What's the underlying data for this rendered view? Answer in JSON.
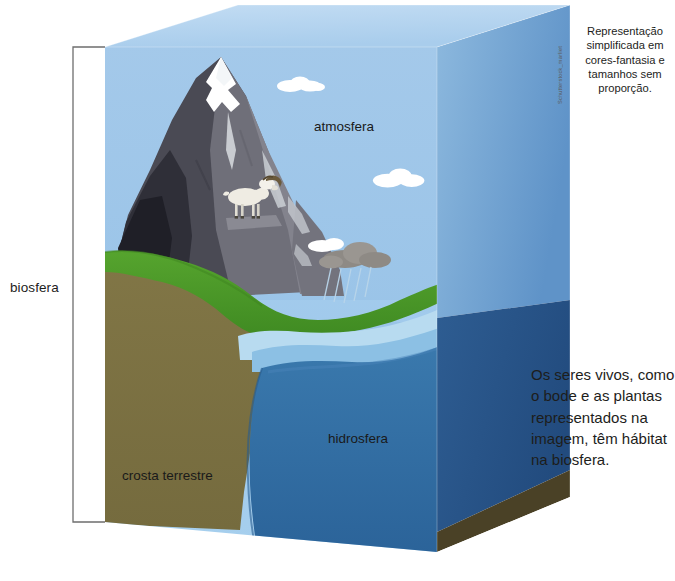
{
  "figure": {
    "title_credit": "Schutterstock_marliet",
    "caption": "Representação simplificada em cores-fantasia e tamanhos sem proporção.",
    "side_note": "Os seres vivos, como o bode e as plantas representados na imagem, têm hábitat na biosfera.",
    "bracket_label": "biosfera",
    "layers": [
      {
        "key": "atmosfera",
        "label": "atmosfera"
      },
      {
        "key": "hidrosfera",
        "label": "hidrosfera"
      },
      {
        "key": "crosta",
        "label": "crosta terrestre"
      }
    ]
  },
  "colors": {
    "sky_top": "#a9cdec",
    "sky_bottom": "#8fbde3",
    "cube_top_face": "#bcd8f0",
    "cube_right_face_sky": "#6f9fd0",
    "water_front": "#2f6ca5",
    "water_right": "#27558a",
    "water_surface": "#8cc0e4",
    "water_shallow": "#b9dcf0",
    "crust_front": "#7d7343",
    "crust_right": "#564b28",
    "grass": "#4c9a2a",
    "mountain_dark": "#3b3b44",
    "mountain_mid": "#6a6a74",
    "mountain_light": "#8d8d96",
    "snow": "#ffffff",
    "cloud": "#ffffff",
    "rain_cloud": "#8e8a85",
    "goat_body": "#efece3",
    "goat_horn": "#6b5a3c",
    "bracket": "#6e6e6e",
    "text": "#1d1d1b"
  },
  "icons": {
    "goat": "goat-icon",
    "cloud": "cloud-icon",
    "rain_cloud": "rain-cloud-icon",
    "mountain": "mountain-icon"
  }
}
